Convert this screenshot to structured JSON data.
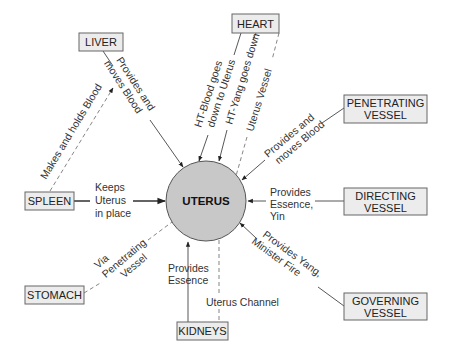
{
  "center": {
    "label": "UTERUS",
    "fill": "#c8c8c8"
  },
  "nodes": {
    "liver": {
      "label": "LIVER"
    },
    "heart": {
      "label": "HEART"
    },
    "penetrating": {
      "line1": "PENETRATING",
      "line2": "VESSEL"
    },
    "spleen": {
      "label": "SPLEEN"
    },
    "directing": {
      "line1": "DIRECTING",
      "line2": "VESSEL"
    },
    "stomach": {
      "label": "STOMACH"
    },
    "kidneys": {
      "label": "KIDNEYS"
    },
    "governing": {
      "line1": "GOVERNING",
      "line2": "VESSEL"
    }
  },
  "edges": {
    "liver_uterus": {
      "line1": "Provides and",
      "line2": "moves Blood"
    },
    "spleen_liver": {
      "label": "Makes and holds Blood"
    },
    "heart_blood": {
      "line1": "HT-Blood goes",
      "line2": "down to Uterus"
    },
    "heart_yang": {
      "label": "HT-Yang goes down"
    },
    "heart_vessel": {
      "label": "Uterus Vessel"
    },
    "penetrating_uterus": {
      "line1": "Provides and",
      "line2": "moves Blood"
    },
    "spleen_uterus": {
      "line1": "Keeps",
      "line2": "Uterus",
      "line3": "in place"
    },
    "directing_uterus": {
      "line1": "Provides",
      "line2": "Essence,",
      "line3": "Yin"
    },
    "stomach_uterus": {
      "line1": "Via",
      "line2": "Penetrating",
      "line3": "Vessel"
    },
    "kidneys_uterus": {
      "line1": "Provides",
      "line2": "Essence"
    },
    "kidneys_channel": {
      "label": "Uterus Channel"
    },
    "governing_uterus": {
      "line1": "Provides Yang,",
      "line2": "Minister Fire"
    }
  }
}
